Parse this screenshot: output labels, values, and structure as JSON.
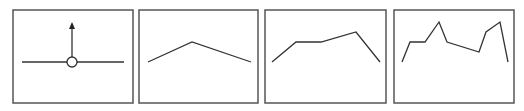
{
  "diagram": {
    "colors": {
      "frame": "#555555",
      "line": "#333333",
      "background": "#ffffff"
    },
    "panels": [
      {
        "id": "panel-1",
        "frame": {
          "x": 13,
          "y": 10,
          "w": 120,
          "h": 93
        },
        "baseline": {
          "x1": 22,
          "y1": 62,
          "x2": 124,
          "y2": 62
        },
        "node": {
          "cx": 72,
          "cy": 62,
          "r": 5
        },
        "arrow": {
          "x": 72,
          "y_from": 57,
          "y_to": 22,
          "direction": "up"
        }
      },
      {
        "id": "panel-2",
        "frame": {
          "x": 139,
          "y": 10,
          "w": 119,
          "h": 93
        },
        "points": "148,62 192,42 251,62"
      },
      {
        "id": "panel-3",
        "frame": {
          "x": 265,
          "y": 10,
          "w": 121,
          "h": 93
        },
        "points": "272,62 296,42 321,42 356,32 380,62"
      },
      {
        "id": "panel-4",
        "frame": {
          "x": 394,
          "y": 10,
          "w": 120,
          "h": 93
        },
        "points": "402,62 410,42 425,42 439,22 447,42 479,52 486,32 500,22 508,62"
      }
    ]
  }
}
